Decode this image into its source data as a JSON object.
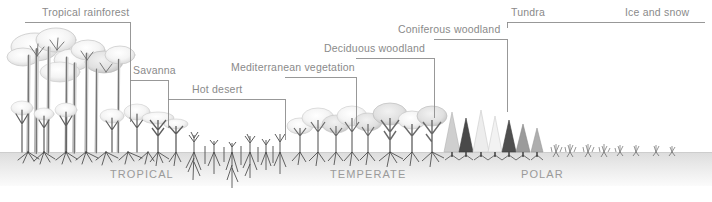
{
  "figure": {
    "title_present": false,
    "canvas": {
      "width": 712,
      "height": 202
    },
    "colors": {
      "label_text": "#8a8a8a",
      "zone_text": "#9a9a9a",
      "bracket_line": "#8d8d8d",
      "ground_top": "#e2e2e2",
      "ground_bottom": "#f7f7f7",
      "vegetation_dark": "#3f3f3f",
      "vegetation_mid": "#9c9c9c",
      "vegetation_light": "#d8d8d8",
      "background": "#ffffff"
    }
  },
  "brackets": [
    {
      "id": "tropical-rainforest",
      "label": "Tropical rainforest",
      "line_y": 22,
      "x_start": 25,
      "x_end": 130,
      "label_x": 42,
      "label_y": 8,
      "left_tick": true,
      "right_drop_to": 122
    },
    {
      "id": "savanna",
      "label": "Savanna",
      "line_y": 80,
      "x_start": 130,
      "x_end": 168,
      "label_x": 133,
      "label_y": 66,
      "left_tick": false,
      "right_drop_to": 128
    },
    {
      "id": "hot-desert",
      "label": "Hot desert",
      "line_y": 99,
      "x_start": 168,
      "x_end": 285,
      "label_x": 192,
      "label_y": 85,
      "left_tick": false,
      "right_drop_to": 140
    },
    {
      "id": "mediterranean-vegetation",
      "label": "Mediterranean vegetation",
      "line_y": 77,
      "x_start": 285,
      "x_end": 356,
      "label_x": 232,
      "label_y": 63,
      "left_tick": false,
      "right_drop_to": 125
    },
    {
      "id": "deciduous-woodland",
      "label": "Deciduous woodland",
      "line_y": 58,
      "x_start": 356,
      "x_end": 434,
      "label_x": 325,
      "label_y": 44,
      "left_tick": false,
      "right_drop_to": 118
    },
    {
      "id": "coniferous-woodland",
      "label": "Coniferous woodland",
      "line_y": 39,
      "x_start": 434,
      "x_end": 507,
      "label_x": 398,
      "label_y": 25,
      "left_tick": false,
      "right_drop_to": 112
    },
    {
      "id": "tundra",
      "label": "Tundra",
      "line_y": 22,
      "x_start": 507,
      "x_end": 705,
      "label_x": 510,
      "label_y": 8,
      "left_tick": true,
      "right_drop_to": 0
    },
    {
      "id": "ice-and-snow",
      "label": "Ice and snow",
      "line_y": 22,
      "x_start": 0,
      "x_end": 0,
      "label_x": 625,
      "label_y": 8,
      "left_tick": false,
      "right_drop_to": 0
    }
  ],
  "zone_labels": [
    {
      "id": "tropical",
      "text": "TROPICAL",
      "x": 110,
      "y": 169
    },
    {
      "id": "temperate",
      "text": "TEMPERATE",
      "x": 330,
      "y": 169
    },
    {
      "id": "polar",
      "text": "POLAR",
      "x": 521,
      "y": 169
    }
  ],
  "ground": {
    "top_y": 152,
    "bottom_y": 186
  },
  "vegetation_zones": [
    {
      "id": "rainforest-canopy",
      "description": "tall multi-layer emergent broadleaf trees with exposed roots",
      "x_range": [
        8,
        150
      ]
    },
    {
      "id": "savanna-trees",
      "description": "spreading flat-crown savanna trees",
      "x_range": [
        150,
        175
      ]
    },
    {
      "id": "desert-plants",
      "description": "sparse small shrubs with deep tap roots",
      "x_range": [
        175,
        285
      ]
    },
    {
      "id": "mediterranean-scrub",
      "description": "low dense evergreen scrub and small trees",
      "x_range": [
        285,
        360
      ]
    },
    {
      "id": "deciduous-trees",
      "description": "broadleaf deciduous trees with bare and leafy crowns",
      "x_range": [
        360,
        440
      ]
    },
    {
      "id": "conifers",
      "description": "conical coniferous trees",
      "x_range": [
        440,
        510
      ]
    },
    {
      "id": "tundra-plants",
      "description": "tiny low tussock plants",
      "x_range": [
        510,
        590
      ]
    }
  ]
}
